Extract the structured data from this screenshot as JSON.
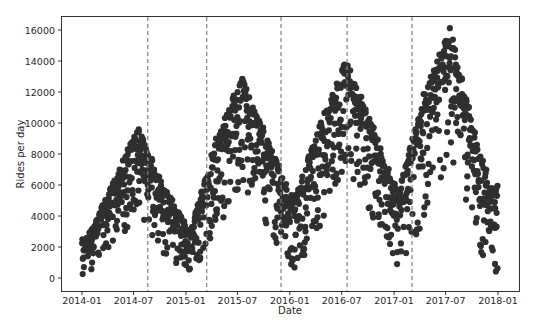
{
  "chart_data": {
    "type": "scatter",
    "title": "",
    "xlabel": "Date",
    "ylabel": "Rides per day",
    "ylim": [
      -800,
      16800
    ],
    "xlim": [
      "2013-11-10",
      "2018-02-15"
    ],
    "grid": false,
    "legend": null,
    "marker_color": "#2f2f2f",
    "vline_color": "#808080",
    "vline_style": "dashed",
    "x_ticks": [
      "2014-01",
      "2014-07",
      "2015-01",
      "2015-07",
      "2016-01",
      "2016-07",
      "2017-01",
      "2017-07",
      "2018-01"
    ],
    "y_ticks": [
      0,
      2000,
      4000,
      6000,
      8000,
      10000,
      12000,
      14000,
      16000
    ],
    "vertical_lines": [
      "2014-08-20",
      "2015-03-15",
      "2015-12-01",
      "2016-07-20",
      "2017-03-05"
    ],
    "series": [
      {
        "name": "daily rides",
        "seasonal_summary": [
          {
            "period": "2014-01",
            "approx_min": 0,
            "approx_max": 2500
          },
          {
            "period": "2014-04",
            "approx_min": 2000,
            "approx_max": 6000
          },
          {
            "period": "2014-07",
            "approx_min": 4000,
            "approx_max": 9800
          },
          {
            "period": "2014-10",
            "approx_min": 1500,
            "approx_max": 6000
          },
          {
            "period": "2015-01",
            "approx_min": 0,
            "approx_max": 3000
          },
          {
            "period": "2015-04",
            "approx_min": 3000,
            "approx_max": 9000
          },
          {
            "period": "2015-07",
            "approx_min": 6000,
            "approx_max": 13000
          },
          {
            "period": "2015-10",
            "approx_min": 3000,
            "approx_max": 9000
          },
          {
            "period": "2016-01",
            "approx_min": 500,
            "approx_max": 5000
          },
          {
            "period": "2016-04",
            "approx_min": 3000,
            "approx_max": 10000
          },
          {
            "period": "2016-07",
            "approx_min": 7000,
            "approx_max": 14100
          },
          {
            "period": "2016-10",
            "approx_min": 4000,
            "approx_max": 10000
          },
          {
            "period": "2017-01",
            "approx_min": 500,
            "approx_max": 5500
          },
          {
            "period": "2017-04",
            "approx_min": 3000,
            "approx_max": 12000
          },
          {
            "period": "2017-07",
            "approx_min": 8000,
            "approx_max": 16200
          },
          {
            "period": "2017-10",
            "approx_min": 2000,
            "approx_max": 9000
          },
          {
            "period": "2017-12",
            "approx_min": 300,
            "approx_max": 6000
          }
        ],
        "peaks": [
          {
            "date": "2014-07",
            "value": 9800
          },
          {
            "date": "2015-07",
            "value": 13000
          },
          {
            "date": "2016-07",
            "value": 14100
          },
          {
            "date": "2017-07",
            "value": 16200
          }
        ],
        "troughs": [
          {
            "date": "2014-01",
            "value": 0
          },
          {
            "date": "2015-02",
            "value": 300
          },
          {
            "date": "2016-01",
            "value": 500
          },
          {
            "date": "2017-01",
            "value": 400
          },
          {
            "date": "2017-12",
            "value": 300
          }
        ]
      }
    ]
  }
}
